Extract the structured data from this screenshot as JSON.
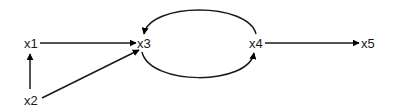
{
  "diagram": {
    "type": "directed-graph",
    "nodes": [
      {
        "id": "x1",
        "label": "x1"
      },
      {
        "id": "x2",
        "label": "x2"
      },
      {
        "id": "x3",
        "label": "x3"
      },
      {
        "id": "x4",
        "label": "x4"
      },
      {
        "id": "x5",
        "label": "x5"
      }
    ],
    "edges": [
      {
        "from": "x1",
        "to": "x3",
        "shape": "straight"
      },
      {
        "from": "x2",
        "to": "x1",
        "shape": "straight"
      },
      {
        "from": "x2",
        "to": "x3",
        "shape": "straight"
      },
      {
        "from": "x3",
        "to": "x4",
        "shape": "curve-below"
      },
      {
        "from": "x4",
        "to": "x3",
        "shape": "curve-above"
      },
      {
        "from": "x4",
        "to": "x5",
        "shape": "straight"
      }
    ],
    "colors": {
      "background": "#ffffff",
      "stroke": "#1a1a1a",
      "text": "#1a1a1a"
    }
  }
}
